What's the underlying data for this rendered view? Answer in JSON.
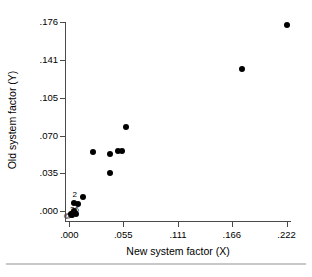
{
  "chart_data": {
    "type": "scatter",
    "title": "",
    "xlabel": "New system factor (X)",
    "ylabel": "Old system factor (Y)",
    "xlim": [
      -0.0045,
      0.2265
    ],
    "ylim": [
      -0.0096,
      0.176
    ],
    "grid": false,
    "legend": "none",
    "marker_color": "#000000",
    "axis_color": "#4a4a4a",
    "xticks": [
      {
        "value": 0.0,
        "label": ".000"
      },
      {
        "value": 0.055,
        "label": ".055"
      },
      {
        "value": 0.111,
        "label": ".111"
      },
      {
        "value": 0.166,
        "label": ".166"
      },
      {
        "value": 0.222,
        "label": ".222"
      }
    ],
    "yticks": [
      {
        "value": 0.0,
        "label": ".000"
      },
      {
        "value": 0.035,
        "label": ".035"
      },
      {
        "value": 0.07,
        "label": ".070"
      },
      {
        "value": 0.105,
        "label": ".105"
      },
      {
        "value": 0.141,
        "label": ".141"
      },
      {
        "value": 0.176,
        "label": ".176"
      }
    ],
    "points": [
      {
        "x": 0.222,
        "y": 0.173
      },
      {
        "x": 0.176,
        "y": 0.132
      },
      {
        "x": 0.0575,
        "y": 0.078
      },
      {
        "x": 0.0535,
        "y": 0.0555
      },
      {
        "x": 0.0495,
        "y": 0.0555
      },
      {
        "x": 0.0415,
        "y": 0.053
      },
      {
        "x": 0.0238,
        "y": 0.0545
      },
      {
        "x": 0.042,
        "y": 0.0355
      },
      {
        "x": 0.0143,
        "y": 0.0128
      },
      {
        "x": 0.0085,
        "y": 0.006
      },
      {
        "x": 0.005,
        "y": 0.0075
      },
      {
        "x": 0.0052,
        "y": 0.0
      },
      {
        "x": 0.005,
        "y": -0.002
      },
      {
        "x": 0.0068,
        "y": -0.0035
      },
      {
        "x": 0.003,
        "y": -0.004
      },
      {
        "x": 0.0012,
        "y": -0.003
      }
    ],
    "point_labels": [
      {
        "text": "2",
        "x": 0.0055,
        "y": 0.0148
      },
      {
        "text": "26",
        "x": 0.0052,
        "y": 0.001
      },
      {
        "text": "3",
        "x": 0.0022,
        "y": -0.0045
      },
      {
        "text": "@",
        "x": -0.0018,
        "y": -0.0048
      }
    ],
    "annotation_note": "Overlapping markers near the origin are labelled with the number of coincident observations."
  }
}
